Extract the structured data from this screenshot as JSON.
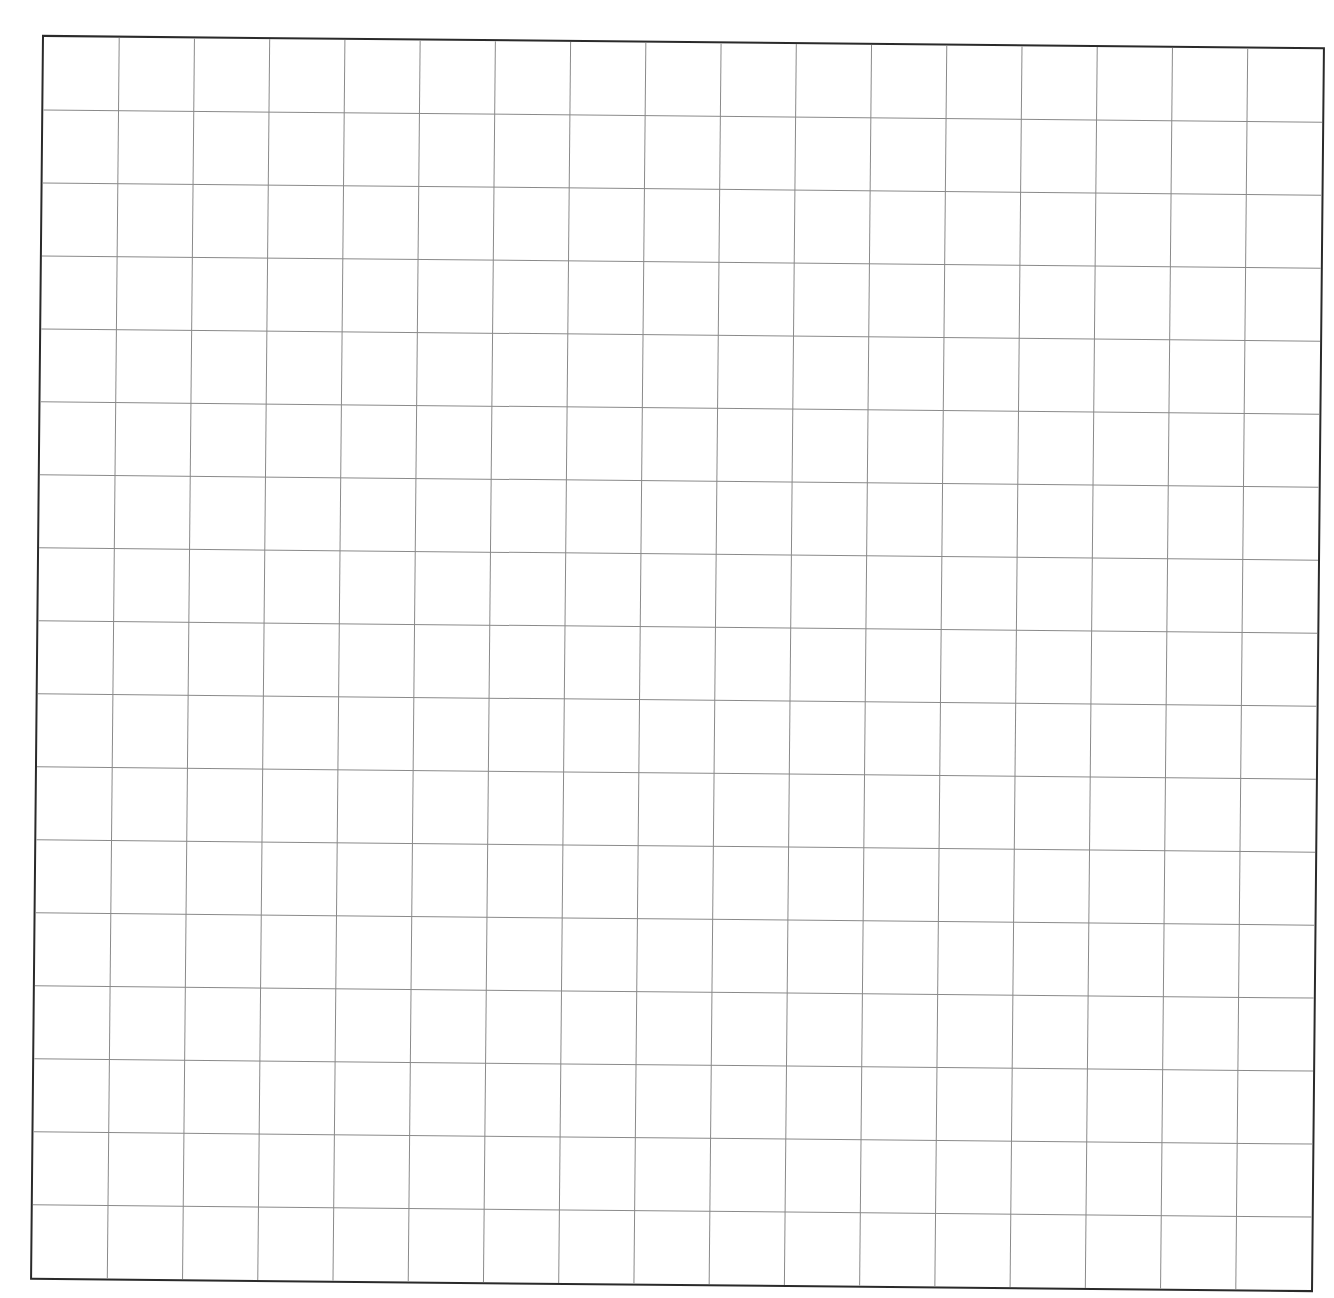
{
  "sheet": {
    "type": "grid-paper",
    "columns": 17,
    "rows": 17,
    "line_color": "#8a8a8a",
    "border_color": "#2a2a2a",
    "background": "#ffffff"
  }
}
